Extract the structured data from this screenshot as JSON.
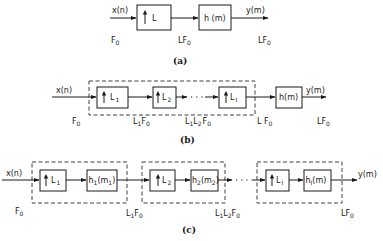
{
  "diagram": {
    "a": {
      "caption": "(a)",
      "input_label": "x(n)",
      "output_label": "y(m)",
      "upsampler": {
        "factor": "L"
      },
      "filter": {
        "label": "h (m)"
      },
      "rates": [
        "F",
        "LF",
        "LF"
      ],
      "rate_sub": "0"
    },
    "b": {
      "caption": "(b)",
      "input_label": "x(n)",
      "output_label": "y(m)",
      "upsamplers": [
        {
          "base": "L",
          "sub": "1"
        },
        {
          "base": "L",
          "sub": "2"
        },
        {
          "base": "L",
          "sub": "I"
        }
      ],
      "ellipsis": "· · ·",
      "filter": {
        "label": "h(m)"
      },
      "rates": [
        {
          "pre": "F",
          "sub": "0"
        },
        {
          "pre": "L",
          "s1": "1",
          "mid": "F",
          "sub": "0"
        },
        {
          "pre": "L",
          "s1": "1",
          "mid": "L",
          "s2": "2",
          "post": "F",
          "sub": "0"
        },
        {
          "pre": "L F",
          "sub": "0"
        },
        {
          "pre": "LF",
          "sub": "0"
        }
      ]
    },
    "c": {
      "caption": "(c)",
      "input_label": "x(n)",
      "output_label": "y(m)",
      "stages": [
        {
          "up_base": "L",
          "up_sub": "1",
          "filt_base": "h",
          "filt_sub": "1",
          "filt_arg": "(m",
          "filt_arg_sub": "1",
          "filt_close": ")"
        },
        {
          "up_base": "L",
          "up_sub": "2",
          "filt_base": "h",
          "filt_sub": "2",
          "filt_arg": "(m",
          "filt_arg_sub": "2",
          "filt_close": ")"
        },
        {
          "up_base": "L",
          "up_sub": "I",
          "filt_base": "h",
          "filt_sub": "I",
          "filt_arg": "(m)",
          "filt_arg_sub": "",
          "filt_close": ""
        }
      ],
      "ellipsis": "· · ·",
      "rates": [
        {
          "pre": "F",
          "sub": "0"
        },
        {
          "pre": "L",
          "s1": "1",
          "mid": "F",
          "sub": "0"
        },
        {
          "pre": "L",
          "s1": "1",
          "mid": "L",
          "s2": "2",
          "post": "F",
          "sub": "0"
        },
        {
          "pre": "LF",
          "sub": "0"
        }
      ]
    }
  }
}
